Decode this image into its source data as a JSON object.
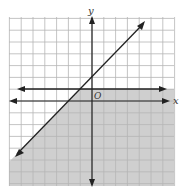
{
  "graph": {
    "axis_labels": {
      "x": "x",
      "y": "y",
      "origin": "O"
    },
    "grid": {
      "xmin": -7,
      "xmax": 7,
      "ymin": -7,
      "ymax": 7,
      "step": 1
    },
    "lines": [
      {
        "name": "boundary-horizontal",
        "equation": "y = 1",
        "style": "solid",
        "arrows": "both"
      },
      {
        "name": "boundary-diagonal",
        "equation": "y = x + 2",
        "style": "solid",
        "arrows": "both"
      }
    ],
    "shaded_region": {
      "description": "y ≤ 1 and y ≤ x + 2",
      "color": "#c9c9c9"
    },
    "colors": {
      "grid": "#b5b5b5",
      "axis": "#222222",
      "line": "#222222",
      "shade": "#cfcfcf"
    }
  }
}
